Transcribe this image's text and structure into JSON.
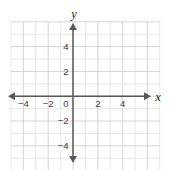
{
  "figure": {
    "kind": "coordinate-plane",
    "width": 172,
    "height": 170,
    "background_color": "#ffffff",
    "grid_color": "#dcdcdc",
    "axis_color": "#58585a",
    "label_color": "#3c3c3c"
  },
  "axis_names": {
    "x": "x",
    "y": "y"
  },
  "origin_label": "0",
  "chart_data": {
    "type": "scatter",
    "title": "",
    "subtitle": "",
    "xlabel": "x",
    "ylabel": "y",
    "xlim": [
      -5,
      7
    ],
    "ylim": [
      -6,
      6
    ],
    "grid": true,
    "grid_step": 1,
    "legend": null,
    "legend_position": "none",
    "x_tick_values": [
      -4,
      -2,
      0,
      2,
      4
    ],
    "x_tick_labels": [
      "−4",
      "−2",
      "0",
      "2",
      "4"
    ],
    "y_tick_values": [
      4,
      2,
      -2,
      -4
    ],
    "y_tick_labels": [
      "4",
      "2",
      "−2",
      "−4"
    ],
    "tick_step": 2,
    "series": [
      {
        "name": "",
        "values": []
      }
    ],
    "annotations": [],
    "arrowheads": [
      "x-positive",
      "x-negative",
      "y-positive",
      "y-negative"
    ]
  }
}
